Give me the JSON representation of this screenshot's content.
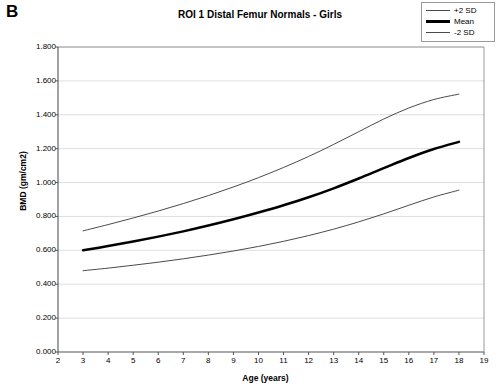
{
  "figure": {
    "panel_letter": "B",
    "title": "ROI 1 Distal Femur Normals - Girls"
  },
  "legend": {
    "position": "top-right",
    "entries": [
      {
        "label": "+2 SD",
        "style": "thin",
        "color": "#4a4a4a"
      },
      {
        "label": "Mean",
        "style": "thick",
        "color": "#000000"
      },
      {
        "label": "-2 SD",
        "style": "thin",
        "color": "#4a4a4a"
      }
    ]
  },
  "axes": {
    "x_title": "Age (years)",
    "y_title": "BMD (gm/cm2)",
    "x_ticks": [
      "2",
      "3",
      "4",
      "5",
      "6",
      "7",
      "8",
      "9",
      "10",
      "11",
      "12",
      "13",
      "14",
      "15",
      "16",
      "17",
      "18",
      "19"
    ],
    "y_ticks": [
      "0.000",
      "0.200",
      "0.400",
      "0.600",
      "0.800",
      "1.000",
      "1.200",
      "1.400",
      "1.600",
      "1.800"
    ]
  },
  "chart_data": {
    "type": "line",
    "title": "ROI 1 Distal Femur Normals - Girls",
    "xlabel": "Age (years)",
    "ylabel": "BMD (gm/cm2)",
    "xlim": [
      2,
      19
    ],
    "ylim": [
      0.0,
      1.8
    ],
    "xtick_step": 1,
    "ytick_step": 0.2,
    "grid": "horizontal",
    "legend_position": "top-right",
    "x": [
      3,
      4,
      5,
      6,
      7,
      8,
      9,
      10,
      11,
      12,
      13,
      14,
      15,
      16,
      17,
      18
    ],
    "series": [
      {
        "name": "+2 SD",
        "color": "#4a4a4a",
        "width": 1,
        "values": [
          0.715,
          0.752,
          0.791,
          0.832,
          0.876,
          0.923,
          0.974,
          1.029,
          1.089,
          1.154,
          1.225,
          1.3,
          1.375,
          1.44,
          1.49,
          1.522
        ]
      },
      {
        "name": "Mean",
        "color": "#000000",
        "width": 2.5,
        "values": [
          0.6,
          0.625,
          0.652,
          0.681,
          0.712,
          0.746,
          0.783,
          0.823,
          0.866,
          0.913,
          0.966,
          1.024,
          1.085,
          1.145,
          1.198,
          1.24
        ]
      },
      {
        "name": "-2 SD",
        "color": "#4a4a4a",
        "width": 1,
        "values": [
          0.48,
          0.495,
          0.512,
          0.53,
          0.55,
          0.572,
          0.596,
          0.623,
          0.653,
          0.687,
          0.725,
          0.768,
          0.815,
          0.866,
          0.915,
          0.955
        ]
      }
    ]
  }
}
